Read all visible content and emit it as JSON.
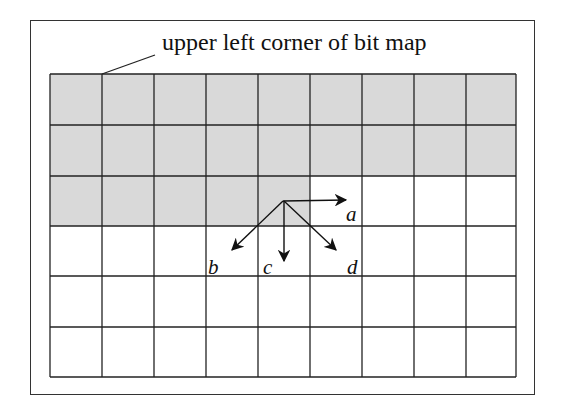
{
  "figure": {
    "caption": "upper left corner of bit map",
    "grid": {
      "columns": 9,
      "rows": 6,
      "shaded_rows_full": 2,
      "shaded_cells_row3": 5,
      "shade_color": "#d9d9d9",
      "line_color": "#222222"
    },
    "arrows": [
      {
        "label": "a",
        "direction": "right"
      },
      {
        "label": "b",
        "direction": "down-left"
      },
      {
        "label": "c",
        "direction": "down"
      },
      {
        "label": "d",
        "direction": "down-right"
      }
    ]
  }
}
